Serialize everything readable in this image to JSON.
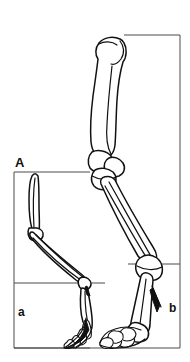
{
  "figure": {
    "panel_label": "A",
    "caption_visible": false,
    "background_color": "#ffffff",
    "line_color": "#111111",
    "frame_color": "#4a4a4a",
    "width_px": 190,
    "height_px": 362
  },
  "labels": {
    "panel": "A",
    "small_box": "a",
    "large_box": "b"
  },
  "specimens": [
    {
      "id": "small-limb",
      "box_label": "a",
      "description": "small hindlimb skeleton, digitigrade foot",
      "bounding_box": {
        "x": 14,
        "y": 172,
        "width": 76,
        "height": 176
      },
      "segments": [
        "femur",
        "tibia-fibula",
        "metatarsus",
        "phalanges"
      ]
    },
    {
      "id": "large-limb",
      "box_label": "b",
      "description": "large hindlimb skeleton, broad phalanges",
      "bounding_box": {
        "x": 124,
        "y": 35,
        "width": 56,
        "height": 313
      },
      "segments": [
        "femur",
        "patella",
        "tibia-fibula",
        "metatarsus",
        "splint-bone",
        "phalanges"
      ]
    }
  ],
  "guides": [
    {
      "id": "ankle-line-small",
      "y": 283,
      "x1": 14,
      "x2": 105
    },
    {
      "id": "ankle-line-large",
      "y": 264,
      "x1": 128,
      "x2": 180
    },
    {
      "id": "ground-line",
      "y": 348,
      "x1": 14,
      "x2": 180
    }
  ]
}
